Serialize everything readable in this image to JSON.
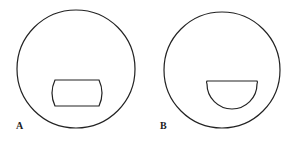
{
  "figure": {
    "panels": [
      {
        "label": "A",
        "outer_shape": "circle",
        "inner_shape": "rounded-rectangle-with-convex-sides"
      },
      {
        "label": "B",
        "outer_shape": "circle",
        "inner_shape": "semicircle-flat-top"
      }
    ],
    "colors": {
      "stroke": "#222222",
      "background": "#ffffff"
    }
  }
}
